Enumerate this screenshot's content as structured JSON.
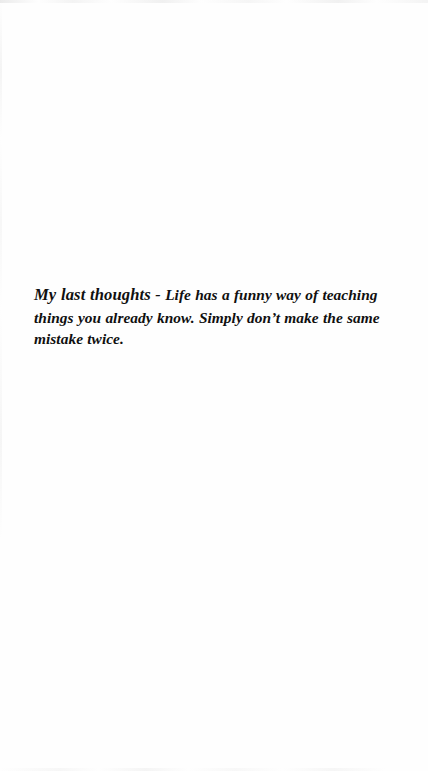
{
  "page": {
    "background_color": "#ffffff",
    "text_color": "#101010",
    "kind": "scanned-book-page"
  },
  "passage": {
    "lead_in": "My last thoughts",
    "separator": " - ",
    "body": "Life has a funny way of teaching things you already know. Simply don’t make the same mistake twice.",
    "full_text": "My last thoughts - Life has a funny way of teaching things you already know. Simply don’t make the same mistake twice."
  }
}
